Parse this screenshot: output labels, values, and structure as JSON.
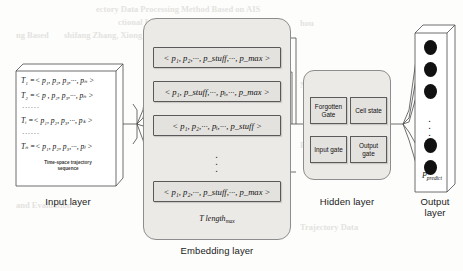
{
  "figure": {
    "type": "neural-network-architecture-diagram"
  },
  "input_layer": {
    "label": "Input layer",
    "caption_line1": "Time-space trajectory",
    "caption_line2": "sequence",
    "rows": [
      {
        "kind": "seq",
        "text": "T₁ =< p₁, p₂, p₃,···, pₙ >"
      },
      {
        "kind": "seq",
        "text": "T₂ =< p , p₂, p₃,···, pₙ >"
      },
      {
        "kind": "dots",
        "text": "······"
      },
      {
        "kind": "seq",
        "text": "Tᵢ =< p₁, p₂, p₃,···, pₖ >"
      },
      {
        "kind": "dots",
        "text": "······"
      },
      {
        "kind": "seq",
        "text": "Tₙ =< p₁, p₂, p₃,···, pₗ >"
      }
    ]
  },
  "embedding_layer": {
    "label": "Embedding layer",
    "length_label": "T length",
    "length_sub": "max",
    "rows": [
      "< p₁, p₂,···, p_stuff,···, p_max >",
      "< p₁, p_stuff,···, pᵢ,···, p_max >",
      "< p₁, p₂,···, pᵢ,···, p_stuff >",
      "< p₁, p₂,···, p_stuff,···, p_max >"
    ],
    "vertical_dots": "·"
  },
  "hidden_layer": {
    "label": "Hidden layer",
    "gates": [
      {
        "name": "forgotten-gate",
        "line1": "Forgotten",
        "line2": "Gate"
      },
      {
        "name": "cell-state",
        "line1": "Cell state",
        "line2": ""
      },
      {
        "name": "input-gate",
        "line1": "Input gate",
        "line2": ""
      },
      {
        "name": "output-gate",
        "line1": "Output",
        "line2": "gate"
      }
    ]
  },
  "output_layer": {
    "label_line1": "Output",
    "label_line2": "layer",
    "prediction_label": "P",
    "prediction_sub": "predict",
    "node_count": 5,
    "vertical_dots": "·"
  },
  "ghost_text": [
    {
      "text": "ectory Data Processing Method Based on AIS",
      "x": 96,
      "y": 4
    },
    {
      "text": "ctional LSTM",
      "x": 118,
      "y": 17
    },
    {
      "text": "ng Based",
      "x": 16,
      "y": 30
    },
    {
      "text": "shifang Zhang, Xiong Deng,",
      "x": 64,
      "y": 30
    },
    {
      "text": "hou",
      "x": 300,
      "y": 18
    },
    {
      "text": "Network Based on AIS",
      "x": 300,
      "y": 80
    },
    {
      "text": "nalysis",
      "x": 16,
      "y": 96
    },
    {
      "text": "Prediction",
      "x": 300,
      "y": 140
    },
    {
      "text": "and Evaluation",
      "x": 16,
      "y": 200
    },
    {
      "text": "Trajectory Data",
      "x": 300,
      "y": 222
    }
  ],
  "colors": {
    "panel_fill": "#eceae6",
    "box_fill": "#e4e2de",
    "line": "#4a4a4a",
    "text": "#111111",
    "node": "#111111"
  }
}
